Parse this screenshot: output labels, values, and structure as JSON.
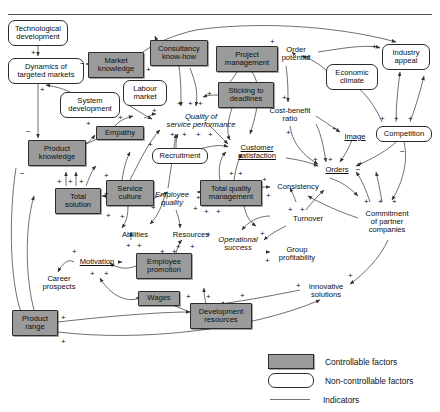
{
  "page": {
    "top_partial_text": "",
    "width": 440,
    "height": 412
  },
  "legend": {
    "items": [
      {
        "swatch": "controllable",
        "label": "Controllable factors"
      },
      {
        "swatch": "non-controllable",
        "label": "Non-controllable factors"
      },
      {
        "swatch": "indicator-line",
        "label": "Indicators"
      }
    ]
  },
  "colors": {
    "controllable_fill": "#9b9b9b",
    "node_border": "#2b2b2b",
    "link": "#555555",
    "text": "#0d0d0d",
    "background": "#ffffff"
  },
  "diagram": {
    "type": "causal-loop-diagram",
    "nodes": [
      {
        "id": "tech-dev",
        "label": "Technological\ndevelopment",
        "kind": "non-controllable",
        "x": 8,
        "y": 20,
        "w": 60,
        "h": 26
      },
      {
        "id": "dyn-markets",
        "label": "Dynamics of\ntargeted markets",
        "kind": "non-controllable",
        "x": 8,
        "y": 58,
        "w": 76,
        "h": 26
      },
      {
        "id": "market-knowledge",
        "label": "Market\nknowledge",
        "kind": "controllable",
        "x": 88,
        "y": 52,
        "w": 56,
        "h": 26
      },
      {
        "id": "system-dev",
        "label": "System\ndevelopment",
        "kind": "non-controllable",
        "x": 60,
        "y": 92,
        "w": 60,
        "h": 26
      },
      {
        "id": "consultancy",
        "label": "Consultancy\nknow-how",
        "kind": "controllable",
        "x": 150,
        "y": 40,
        "w": 58,
        "h": 26
      },
      {
        "id": "project-mgmt",
        "label": "Project\nmanagement",
        "kind": "controllable",
        "x": 216,
        "y": 46,
        "w": 62,
        "h": 26
      },
      {
        "id": "labour-market",
        "label": "Labour\nmarket",
        "kind": "non-controllable",
        "x": 123,
        "y": 80,
        "w": 44,
        "h": 26
      },
      {
        "id": "sticking",
        "label": "Sticking to\ndeadlines",
        "kind": "controllable",
        "x": 218,
        "y": 82,
        "w": 56,
        "h": 26
      },
      {
        "id": "quality-serv",
        "label": "Quality of\nservice performance",
        "kind": "italic",
        "x": 157,
        "y": 110,
        "w": 88,
        "h": 22
      },
      {
        "id": "empathy",
        "label": "Empathy",
        "kind": "controllable",
        "x": 96,
        "y": 126,
        "w": 48,
        "h": 14
      },
      {
        "id": "product-know",
        "label": "Product\nknowledge",
        "kind": "controllable",
        "x": 28,
        "y": 140,
        "w": 58,
        "h": 26
      },
      {
        "id": "recruitment",
        "label": "Recruitment",
        "kind": "non-controllable",
        "x": 152,
        "y": 148,
        "w": 56,
        "h": 16
      },
      {
        "id": "total-solution",
        "label": "Total\nsolution",
        "kind": "controllable",
        "x": 55,
        "y": 188,
        "w": 46,
        "h": 26
      },
      {
        "id": "service-culture",
        "label": "Service\nculture",
        "kind": "controllable",
        "x": 106,
        "y": 180,
        "w": 48,
        "h": 26
      },
      {
        "id": "employee-quality",
        "label": "Employee\nquality",
        "kind": "italic",
        "x": 148,
        "y": 188,
        "w": 48,
        "h": 22
      },
      {
        "id": "tqm",
        "label": "Total quality\nmanagement",
        "kind": "controllable",
        "x": 200,
        "y": 180,
        "w": 62,
        "h": 26
      },
      {
        "id": "customer-sat",
        "label": "Customer\nsatisfaction",
        "kind": "indicator",
        "x": 228,
        "y": 141,
        "w": 58,
        "h": 22
      },
      {
        "id": "order-potential",
        "label": "Order\npotential",
        "kind": "plain",
        "x": 274,
        "y": 43,
        "w": 44,
        "h": 22
      },
      {
        "id": "econ-climate",
        "label": "Economic\nclimate",
        "kind": "non-controllable",
        "x": 326,
        "y": 64,
        "w": 52,
        "h": 26
      },
      {
        "id": "industry-appeal",
        "label": "Industry\nappeal",
        "kind": "non-controllable",
        "x": 382,
        "y": 44,
        "w": 48,
        "h": 26
      },
      {
        "id": "cost-benefit",
        "label": "Cost-benefit\nratio",
        "kind": "plain",
        "x": 264,
        "y": 104,
        "w": 52,
        "h": 22
      },
      {
        "id": "image",
        "label": "Image",
        "kind": "indicator",
        "x": 340,
        "y": 131,
        "w": 30,
        "h": 12
      },
      {
        "id": "competition",
        "label": "Competition",
        "kind": "non-controllable",
        "x": 376,
        "y": 126,
        "w": 56,
        "h": 16
      },
      {
        "id": "orders",
        "label": "Orders",
        "kind": "indicator",
        "x": 320,
        "y": 164,
        "w": 34,
        "h": 12
      },
      {
        "id": "consistency",
        "label": "Consistency",
        "kind": "plain",
        "x": 272,
        "y": 181,
        "w": 52,
        "h": 12
      },
      {
        "id": "turnover",
        "label": "Turnover",
        "kind": "plain",
        "x": 288,
        "y": 213,
        "w": 40,
        "h": 12
      },
      {
        "id": "commitment",
        "label": "Commitment\nof partner\ncompanies",
        "kind": "plain",
        "x": 358,
        "y": 206,
        "w": 58,
        "h": 32
      },
      {
        "id": "abilities",
        "label": "Abilities",
        "kind": "plain",
        "x": 116,
        "y": 229,
        "w": 38,
        "h": 12
      },
      {
        "id": "resources",
        "label": "Resources",
        "kind": "plain",
        "x": 168,
        "y": 229,
        "w": 46,
        "h": 12
      },
      {
        "id": "operational",
        "label": "Operational\nsuccess",
        "kind": "italic",
        "x": 212,
        "y": 233,
        "w": 52,
        "h": 22
      },
      {
        "id": "group-profit",
        "label": "Group\nprofitability",
        "kind": "plain",
        "x": 272,
        "y": 243,
        "w": 50,
        "h": 22
      },
      {
        "id": "motivation",
        "label": "Motivation",
        "kind": "indicator",
        "x": 74,
        "y": 256,
        "w": 46,
        "h": 12
      },
      {
        "id": "employee-promo",
        "label": "Employee\npromotion",
        "kind": "controllable",
        "x": 136,
        "y": 253,
        "w": 56,
        "h": 26
      },
      {
        "id": "career-prosp",
        "label": "Career\nprospects",
        "kind": "plain",
        "x": 36,
        "y": 272,
        "w": 46,
        "h": 22
      },
      {
        "id": "innovative",
        "label": "Innovative\nsolutions",
        "kind": "plain",
        "x": 302,
        "y": 280,
        "w": 48,
        "h": 22
      },
      {
        "id": "wages",
        "label": "Wages",
        "kind": "controllable",
        "x": 138,
        "y": 291,
        "w": 42,
        "h": 15
      },
      {
        "id": "dev-resources",
        "label": "Development\nresources",
        "kind": "controllable",
        "x": 190,
        "y": 303,
        "w": 62,
        "h": 26
      },
      {
        "id": "product-range",
        "label": "Product\nrange",
        "kind": "controllable",
        "x": 12,
        "y": 310,
        "w": 46,
        "h": 26
      }
    ],
    "polarity_marks": [
      {
        "sign": "+",
        "x": 31,
        "y": 49
      },
      {
        "sign": "−",
        "x": 80,
        "y": 60
      },
      {
        "sign": "+",
        "x": 40,
        "y": 86
      },
      {
        "sign": "−",
        "x": 26,
        "y": 128
      },
      {
        "sign": "−",
        "x": 20,
        "y": 170
      },
      {
        "sign": "+",
        "x": 86,
        "y": 120
      },
      {
        "sign": "+",
        "x": 118,
        "y": 114
      },
      {
        "sign": "+",
        "x": 146,
        "y": 66
      },
      {
        "sign": "+",
        "x": 177,
        "y": 100
      },
      {
        "sign": "+",
        "x": 188,
        "y": 100
      },
      {
        "sign": "+",
        "x": 198,
        "y": 100
      },
      {
        "sign": "+",
        "x": 152,
        "y": 107
      },
      {
        "sign": "+",
        "x": 207,
        "y": 90
      },
      {
        "sign": "+",
        "x": 170,
        "y": 131
      },
      {
        "sign": "+",
        "x": 182,
        "y": 131
      },
      {
        "sign": "+",
        "x": 196,
        "y": 131
      },
      {
        "sign": "+",
        "x": 208,
        "y": 131
      },
      {
        "sign": "+",
        "x": 148,
        "y": 141
      },
      {
        "sign": "+",
        "x": 57,
        "y": 178
      },
      {
        "sign": "+",
        "x": 68,
        "y": 178
      },
      {
        "sign": "+",
        "x": 79,
        "y": 178
      },
      {
        "sign": "+",
        "x": 104,
        "y": 172
      },
      {
        "sign": "+",
        "x": 104,
        "y": 190
      },
      {
        "sign": "+",
        "x": 106,
        "y": 212
      },
      {
        "sign": "+",
        "x": 120,
        "y": 213
      },
      {
        "sign": "+",
        "x": 151,
        "y": 204
      },
      {
        "sign": "+",
        "x": 196,
        "y": 194
      },
      {
        "sign": "+",
        "x": 193,
        "y": 205
      },
      {
        "sign": "+",
        "x": 204,
        "y": 208
      },
      {
        "sign": "+",
        "x": 216,
        "y": 208
      },
      {
        "sign": "+",
        "x": 262,
        "y": 176
      },
      {
        "sign": "+",
        "x": 266,
        "y": 192
      },
      {
        "sign": "+",
        "x": 229,
        "y": 170
      },
      {
        "sign": "+",
        "x": 238,
        "y": 170
      },
      {
        "sign": "+",
        "x": 270,
        "y": 38
      },
      {
        "sign": "+",
        "x": 306,
        "y": 53
      },
      {
        "sign": "+",
        "x": 282,
        "y": 94
      },
      {
        "sign": "+",
        "x": 286,
        "y": 129
      },
      {
        "sign": "+",
        "x": 332,
        "y": 125
      },
      {
        "sign": "+",
        "x": 313,
        "y": 156
      },
      {
        "sign": "+",
        "x": 328,
        "y": 156
      },
      {
        "sign": "+",
        "x": 358,
        "y": 160
      },
      {
        "sign": "−",
        "x": 356,
        "y": 166
      },
      {
        "sign": "−",
        "x": 400,
        "y": 148
      },
      {
        "sign": "+",
        "x": 372,
        "y": 43
      },
      {
        "sign": "+",
        "x": 380,
        "y": 115
      },
      {
        "sign": "+",
        "x": 394,
        "y": 115
      },
      {
        "sign": "+",
        "x": 408,
        "y": 115
      },
      {
        "sign": "+",
        "x": 364,
        "y": 198
      },
      {
        "sign": "+",
        "x": 378,
        "y": 198
      },
      {
        "sign": "+",
        "x": 392,
        "y": 198
      },
      {
        "sign": "+",
        "x": 288,
        "y": 206
      },
      {
        "sign": "+",
        "x": 300,
        "y": 206
      },
      {
        "sign": "+",
        "x": 176,
        "y": 243
      },
      {
        "sign": "+",
        "x": 190,
        "y": 243
      },
      {
        "sign": "+",
        "x": 126,
        "y": 242
      },
      {
        "sign": "+",
        "x": 137,
        "y": 242
      },
      {
        "sign": "+",
        "x": 160,
        "y": 248
      },
      {
        "sign": "+",
        "x": 172,
        "y": 248
      },
      {
        "sign": "+",
        "x": 206,
        "y": 231
      },
      {
        "sign": "+",
        "x": 260,
        "y": 230
      },
      {
        "sign": "+",
        "x": 265,
        "y": 257
      },
      {
        "sign": "+",
        "x": 72,
        "y": 248
      },
      {
        "sign": "+",
        "x": 90,
        "y": 270
      },
      {
        "sign": "+",
        "x": 104,
        "y": 270
      },
      {
        "sign": "+",
        "x": 296,
        "y": 282
      },
      {
        "sign": "+",
        "x": 348,
        "y": 272
      },
      {
        "sign": "+",
        "x": 186,
        "y": 293
      },
      {
        "sign": "+",
        "x": 206,
        "y": 293
      },
      {
        "sign": "+",
        "x": 240,
        "y": 292
      },
      {
        "sign": "+",
        "x": 61,
        "y": 314
      },
      {
        "sign": "+",
        "x": 61,
        "y": 338
      }
    ]
  }
}
